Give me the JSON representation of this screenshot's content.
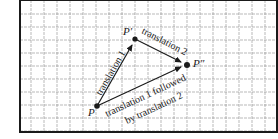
{
  "diagram": {
    "type": "vector-translation",
    "grid": {
      "frame": {
        "x": 20,
        "y": 0,
        "width": 257,
        "height": 132
      },
      "spacing": 13,
      "line_color": "#8a8a8a",
      "frame_color": "#1a1a1a"
    },
    "points": [
      {
        "id": "P",
        "label": "P",
        "x": 97,
        "y": 106,
        "label_x": 88,
        "label_y": 116
      },
      {
        "id": "P1",
        "label": "P′",
        "x": 135,
        "y": 39,
        "label_x": 123,
        "label_y": 35
      },
      {
        "id": "P2",
        "label": "P″",
        "x": 187,
        "y": 65,
        "label_x": 193,
        "label_y": 67
      }
    ],
    "arrows": [
      {
        "id": "translation-1",
        "from": "P",
        "to": "P1",
        "label": "translation 1"
      },
      {
        "id": "translation-2",
        "from": "P1",
        "to": "P2",
        "label": "translation 2"
      },
      {
        "id": "composite",
        "from": "P",
        "to": "P2",
        "label": "translation 1 followed",
        "label_line2": "by translation 2"
      }
    ],
    "ink_color": "#1a1a1a"
  }
}
